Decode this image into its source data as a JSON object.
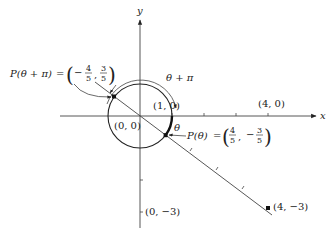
{
  "diagram": {
    "axes": {
      "x_label": "x",
      "y_label": "y",
      "origin_label": "(0, 0)"
    },
    "points": {
      "one_zero": "(1, 0)",
      "four_zero": "(4, 0)",
      "zero_neg3": "(0, −3)",
      "four_neg3": "(4, −3)"
    },
    "p_theta": {
      "lhs": "P(θ)",
      "equals": "=",
      "x_sign": "",
      "x_num": "4",
      "x_den": "5",
      "comma": ",",
      "y_sign": "−",
      "y_num": "3",
      "y_den": "5"
    },
    "p_theta_pi": {
      "lhs": "P(θ + π)",
      "equals": "=",
      "x_sign": "−",
      "x_num": "4",
      "x_den": "5",
      "comma": ",",
      "y_sign": "",
      "y_num": "3",
      "y_den": "5"
    },
    "arc_labels": {
      "theta": "θ",
      "theta_plus_pi": "θ + π"
    },
    "colors": {
      "ink": "#222222",
      "axis": "#444444",
      "background": "#ffffff"
    }
  }
}
